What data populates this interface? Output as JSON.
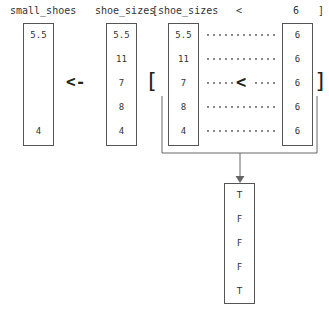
{
  "header": {
    "result_name": "small_shoes",
    "source_name": "shoe_sizes",
    "index_open": "[shoe_sizes",
    "operator": "<",
    "threshold": "6",
    "index_close": "]"
  },
  "symbols": {
    "assign": "<-",
    "bracket_open": "[",
    "bracket_close": "]",
    "compare": "<"
  },
  "small_shoes": [
    "5.5",
    "4"
  ],
  "shoe_sizes": [
    "5.5",
    "11",
    "7",
    "8",
    "4"
  ],
  "index_vector": [
    "5.5",
    "11",
    "7",
    "8",
    "4"
  ],
  "threshold_vector": [
    "6",
    "6",
    "6",
    "6",
    "6"
  ],
  "logical_result": [
    "T",
    "F",
    "F",
    "F",
    "T"
  ]
}
